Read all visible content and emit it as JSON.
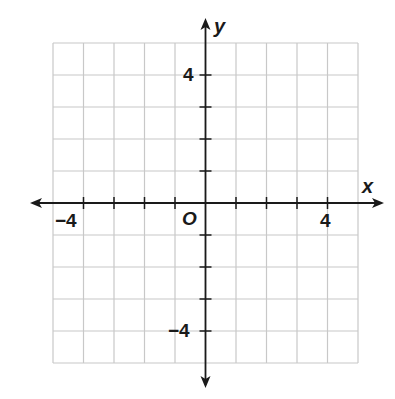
{
  "chart_data": {
    "type": "coordinate-plane",
    "title": "",
    "xlabel": "x",
    "ylabel": "y",
    "origin_label": "O",
    "xlim": [
      -5,
      5
    ],
    "ylim": [
      -5,
      5
    ],
    "grid": true,
    "grid_step": 1,
    "x_tick_labels": [
      {
        "value": -4,
        "label": "−4"
      },
      {
        "value": 4,
        "label": "4"
      }
    ],
    "y_tick_labels": [
      {
        "value": 4,
        "label": "4"
      },
      {
        "value": -4,
        "label": "−4"
      }
    ],
    "series": []
  },
  "labels": {
    "x_axis": "x",
    "y_axis": "y",
    "origin": "O",
    "x_neg4": "−4",
    "x_pos4": "4",
    "y_pos4": "4",
    "y_neg4": "−4"
  },
  "colors": {
    "grid": "#c8c8c8",
    "axis": "#1a1a1a",
    "background": "#ffffff"
  }
}
